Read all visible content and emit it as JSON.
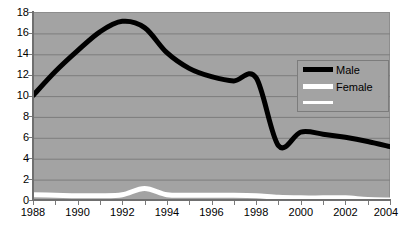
{
  "chart_data": {
    "type": "line",
    "title": "",
    "subtitle": "",
    "xlabel": "",
    "ylabel": "",
    "xlim": [
      1988,
      2004
    ],
    "ylim": [
      0,
      18
    ],
    "grid": true,
    "legend_position": "top-right",
    "plot_background_color": "#a3a3a3",
    "y_ticks": [
      18,
      16,
      14,
      12,
      10,
      8,
      6,
      4,
      2,
      0
    ],
    "x_ticks": [
      1988,
      1990,
      1992,
      1994,
      1996,
      1998,
      2000,
      2002,
      2004
    ],
    "x_minor_ticks": [
      1988,
      1989,
      1990,
      1991,
      1992,
      1993,
      1994,
      1995,
      1996,
      1997,
      1998,
      1999,
      2000,
      2001,
      2002,
      2003,
      2004
    ],
    "x": [
      1988,
      1989,
      1990,
      1991,
      1992,
      1993,
      1994,
      1995,
      1996,
      1997,
      1998,
      1999,
      2000,
      2001,
      2002,
      2003,
      2004
    ],
    "series": [
      {
        "name": "Male",
        "color": "#000000",
        "values": [
          10.1,
          12.4,
          14.4,
          16.2,
          17.2,
          16.6,
          14.2,
          12.7,
          11.9,
          11.5,
          11.8,
          5.3,
          6.6,
          6.4,
          6.1,
          5.7,
          5.2
        ]
      },
      {
        "name": "Female",
        "color": "#ffffff",
        "values": [
          0.6,
          0.55,
          0.5,
          0.5,
          0.6,
          1.2,
          0.6,
          0.55,
          0.55,
          0.55,
          0.5,
          0.35,
          0.3,
          0.3,
          0.3,
          0.15,
          0.1
        ]
      }
    ],
    "annotations": []
  },
  "legend": {
    "rows": [
      {
        "label": "Male",
        "color": "#000000",
        "thickness": 5
      },
      {
        "label": "Female",
        "color": "#ffffff",
        "thickness": 5
      },
      {
        "label": "",
        "color": "#ffffff",
        "thickness": 3
      }
    ]
  }
}
